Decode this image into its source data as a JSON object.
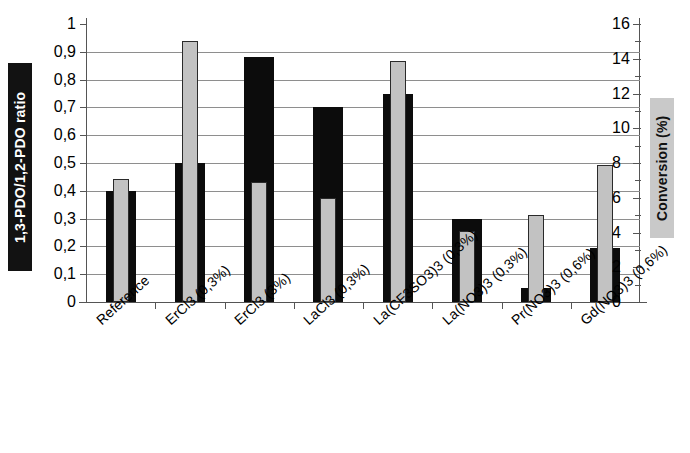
{
  "chart_data": {
    "type": "bar",
    "title": "",
    "subtitle": "",
    "xlabel": "",
    "ylabel": "1,3-PDO/1,2-PDO ratio",
    "y2label": "Conversion (%)",
    "grid": true,
    "legend_position": "none",
    "ylim": [
      0,
      1
    ],
    "y2lim": [
      0,
      16
    ],
    "ytick_labels": [
      "0",
      "0,1",
      "0,2",
      "0,3",
      "0,4",
      "0,5",
      "0,6",
      "0,7",
      "0,8",
      "0,9",
      "1"
    ],
    "ytick_values": [
      0,
      0.1,
      0.2,
      0.3,
      0.4,
      0.5,
      0.6,
      0.7,
      0.8,
      0.9,
      1
    ],
    "y2tick_labels": [
      "0",
      "2",
      "4",
      "6",
      "8",
      "10",
      "12",
      "14",
      "16"
    ],
    "y2tick_values": [
      0,
      2,
      4,
      6,
      8,
      10,
      12,
      14,
      16
    ],
    "categories": [
      "Reference",
      "ErCl3 (0,3%)",
      "ErCl3 (3%)",
      "LaCl3 (0,3%)",
      "La(CF3SO3)3 (0,3%)",
      "La(NO3)3 (0,3%)",
      "Pr(NO3)3 (0,6%)",
      "Gd(NO3)3 (0,6%)"
    ],
    "series": [
      {
        "name": "1,3-PDO/1,2-PDO ratio",
        "axis": "left",
        "color": "#0c0c0c",
        "values": [
          0.4,
          0.5,
          0.88,
          0.7,
          0.75,
          0.3,
          0.05,
          0.195
        ]
      },
      {
        "name": "Conversion (%)",
        "axis": "right",
        "color": "#c2c2c2",
        "values": [
          7.1,
          15.0,
          6.9,
          6.0,
          13.9,
          4.1,
          5.0,
          7.9
        ]
      }
    ]
  },
  "axes": {
    "left_title": "1,3-PDO/1,2-PDO ratio",
    "right_title": "Conversion (%)",
    "left_title_bg": "#121212",
    "left_title_fg": "#ffffff",
    "right_title_bg": "#c9c9c9",
    "right_title_fg": "#111111"
  }
}
